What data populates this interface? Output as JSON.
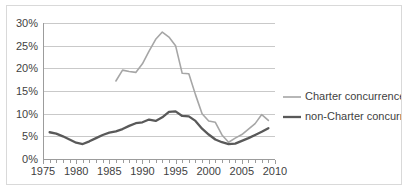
{
  "chart_data": {
    "type": "line",
    "title": "",
    "xlabel": "",
    "ylabel": "",
    "xlim": [
      1975,
      2010
    ],
    "ylim": [
      0,
      30
    ],
    "grid": true,
    "legend_position": "right",
    "y_tick_labels": [
      "30%",
      "25%",
      "20%",
      "15%",
      "10%",
      "5%",
      "0%"
    ],
    "y_tick_values": [
      30,
      25,
      20,
      15,
      10,
      5,
      0
    ],
    "x_tick_labels": [
      "1975",
      "1980",
      "1985",
      "1990",
      "1995",
      "2000",
      "2005",
      "2010"
    ],
    "x_tick_values": [
      1975,
      1980,
      1985,
      1990,
      1995,
      2000,
      2005,
      2010
    ],
    "x_minor_tick_step": 1,
    "series": [
      {
        "name": "Charter concurrences",
        "color": "#a6a6a6",
        "stroke_width": 1.6,
        "x": [
          1986,
          1987,
          1988,
          1989,
          1990,
          1991,
          1992,
          1993,
          1994,
          1995,
          1996,
          1997,
          1998,
          1999,
          2000,
          2001,
          2002,
          2003,
          2004,
          2005,
          2006,
          2007,
          2008,
          2009
        ],
        "values": [
          17.2,
          19.6,
          19.3,
          19.1,
          21.0,
          23.8,
          26.4,
          28.0,
          26.9,
          25.0,
          18.9,
          18.8,
          14.2,
          10.0,
          8.4,
          8.1,
          5.3,
          3.7,
          4.6,
          5.4,
          6.6,
          7.8,
          9.8,
          8.5
        ]
      },
      {
        "name": "non-Charter concurrences",
        "color": "#595959",
        "stroke_width": 2.3,
        "x": [
          1976,
          1977,
          1978,
          1979,
          1980,
          1981,
          1982,
          1983,
          1984,
          1985,
          1986,
          1987,
          1988,
          1989,
          1990,
          1991,
          1992,
          1993,
          1994,
          1995,
          1996,
          1997,
          1998,
          1999,
          2000,
          2001,
          2002,
          2003,
          2004,
          2005,
          2006,
          2007,
          2008,
          2009
        ],
        "values": [
          5.9,
          5.6,
          5.0,
          4.3,
          3.6,
          3.3,
          3.9,
          4.6,
          5.3,
          5.8,
          6.1,
          6.6,
          7.3,
          7.9,
          8.1,
          8.7,
          8.4,
          9.2,
          10.4,
          10.5,
          9.5,
          9.4,
          8.4,
          6.7,
          5.4,
          4.3,
          3.7,
          3.3,
          3.4,
          4.0,
          4.6,
          5.3,
          6.0,
          6.8
        ]
      }
    ]
  },
  "legend": {
    "entries": [
      {
        "label": "Charter concurrences"
      },
      {
        "label": "non-Charter concurrences"
      }
    ]
  }
}
